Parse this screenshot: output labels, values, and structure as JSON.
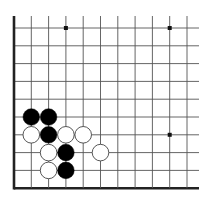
{
  "diagram": {
    "type": "go-board-fragment",
    "columns": 11,
    "rows": 10,
    "origin_x": 14,
    "origin_y": 28,
    "spacing_x": 17.3,
    "spacing_y": 17.8,
    "line_extend_right": 12,
    "line_extend_top": 12,
    "edges": [
      "left",
      "bottom"
    ],
    "colors": {
      "background": "#ffffff",
      "grid_line": "#555555",
      "edge_line": "#222222",
      "black_stone": "#000000",
      "white_stone": "#ffffff",
      "white_stone_outline": "#444444",
      "star_point": "#111111"
    },
    "star_points": [
      {
        "col": 3,
        "row": 0
      },
      {
        "col": 9,
        "row": 0
      },
      {
        "col": 9,
        "row": 6
      }
    ],
    "stones": [
      {
        "color": "black",
        "col": 1,
        "row": 5
      },
      {
        "color": "black",
        "col": 2,
        "row": 5
      },
      {
        "color": "white",
        "col": 1,
        "row": 6
      },
      {
        "color": "black",
        "col": 2,
        "row": 6
      },
      {
        "color": "white",
        "col": 3,
        "row": 6
      },
      {
        "color": "white",
        "col": 4,
        "row": 6
      },
      {
        "color": "white",
        "col": 2,
        "row": 7
      },
      {
        "color": "black",
        "col": 3,
        "row": 7
      },
      {
        "color": "white",
        "col": 5,
        "row": 7
      },
      {
        "color": "white",
        "col": 2,
        "row": 8
      },
      {
        "color": "black",
        "col": 3,
        "row": 8
      }
    ]
  }
}
